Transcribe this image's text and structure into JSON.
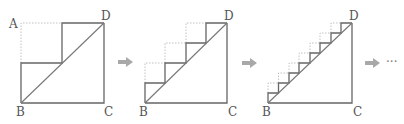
{
  "diagram": {
    "figures": [
      {
        "id": "fig1",
        "steps": 2,
        "labels": {
          "A": "A",
          "B": "B",
          "C": "C",
          "D": "D"
        }
      },
      {
        "id": "fig2",
        "steps": 4,
        "labels": {
          "B": "B",
          "C": "C",
          "D": "D"
        }
      },
      {
        "id": "fig3",
        "steps": 8,
        "labels": {
          "B": "B",
          "C": "C",
          "D": "D"
        }
      }
    ],
    "continuation": "···",
    "colors": {
      "line": "#666666",
      "dashed": "#bbbbbb",
      "arrow": "#a8a8a8"
    }
  }
}
